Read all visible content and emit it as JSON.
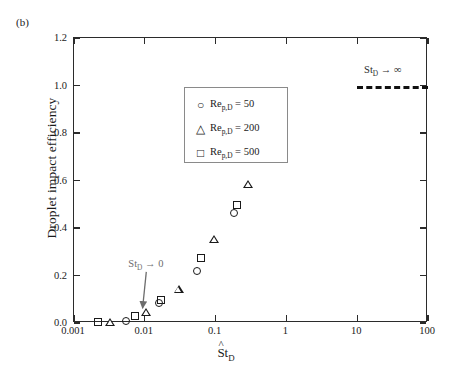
{
  "panel": {
    "label": "(b)"
  },
  "axes": {
    "y_label": "Droplet impact efficiency",
    "x_label_main": "St",
    "x_label_sub": "D",
    "x_label_hat": "^",
    "x_ticks": [
      "0.001",
      "0.01",
      "0.1",
      "1",
      "10",
      "100"
    ],
    "y_ticks": [
      "0.0",
      "0.2",
      "0.4",
      "0.6",
      "0.8",
      "1.0",
      "1.2"
    ]
  },
  "legend": {
    "entries": [
      {
        "marker": "circle",
        "glyph": "○",
        "text_main": "Re",
        "text_sub": "p,D",
        "text_tail": " = 50"
      },
      {
        "marker": "triangle",
        "glyph": "△",
        "text_main": "Re",
        "text_sub": "p,D",
        "text_tail": " = 200"
      },
      {
        "marker": "square",
        "glyph": "□",
        "text_main": "Re",
        "text_sub": "p,D",
        "text_tail": " = 500"
      }
    ]
  },
  "annotations": {
    "limit_zero": {
      "main": "St",
      "sub": "D",
      "tail": " → 0",
      "color": "#6d6d6d"
    },
    "limit_inf": {
      "main": "St",
      "sub": "D",
      "tail": " → ∞",
      "color": "#2b2b2b"
    }
  },
  "chart_data": {
    "type": "scatter",
    "title": "",
    "xlabel": "St̂_D",
    "ylabel": "Droplet impact efficiency",
    "xscale": "log",
    "xlim": [
      0.001,
      100
    ],
    "ylim": [
      0.0,
      1.2
    ],
    "grid": false,
    "legend_position": "upper-left-inside",
    "series": [
      {
        "name": "Re_p,D = 50",
        "marker": "circle",
        "points": [
          {
            "x": 0.0055,
            "y": 0.008
          },
          {
            "x": 0.016,
            "y": 0.085
          },
          {
            "x": 0.055,
            "y": 0.22
          },
          {
            "x": 0.18,
            "y": 0.465
          },
          {
            "x": 0.5,
            "y": 0.69
          }
        ]
      },
      {
        "name": "Re_p,D = 200",
        "marker": "triangle",
        "points": [
          {
            "x": 0.0032,
            "y": 0.006
          },
          {
            "x": 0.0105,
            "y": 0.048
          },
          {
            "x": 0.03,
            "y": 0.145
          },
          {
            "x": 0.095,
            "y": 0.355
          },
          {
            "x": 0.29,
            "y": 0.585
          }
        ]
      },
      {
        "name": "Re_p,D = 500",
        "marker": "square",
        "points": [
          {
            "x": 0.0022,
            "y": 0.004
          },
          {
            "x": 0.0072,
            "y": 0.028
          },
          {
            "x": 0.017,
            "y": 0.098
          },
          {
            "x": 0.062,
            "y": 0.272
          },
          {
            "x": 0.2,
            "y": 0.498
          }
        ]
      }
    ],
    "asymptote_line": {
      "y": 1.0,
      "x_start": 10,
      "x_end": 100,
      "style": "dashed",
      "label": "St_D → ∞"
    },
    "arrow_annotation": {
      "label": "St_D → 0",
      "from": {
        "x": 0.0105,
        "y": 0.215
      },
      "to": {
        "x": 0.0093,
        "y": 0.062
      }
    }
  }
}
